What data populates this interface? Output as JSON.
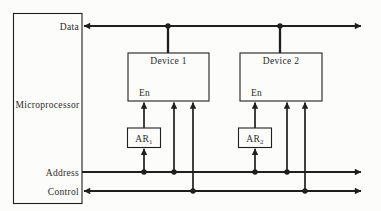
{
  "microprocessor": {
    "label": "Microprocessor"
  },
  "buses": {
    "data": {
      "label": "Data"
    },
    "address": {
      "label": "Address"
    },
    "control": {
      "label": "Control"
    }
  },
  "devices": {
    "device1": {
      "label": "Device 1",
      "enable": "En"
    },
    "device2": {
      "label": "Device 2",
      "enable": "En"
    }
  },
  "registers": {
    "ar1": {
      "base": "AR",
      "sub": "1"
    },
    "ar2": {
      "base": "AR",
      "sub": "2"
    }
  },
  "colors": {
    "line": "#1f1f1f",
    "text": "#2b2b2b",
    "background": "#fcfcfa"
  }
}
